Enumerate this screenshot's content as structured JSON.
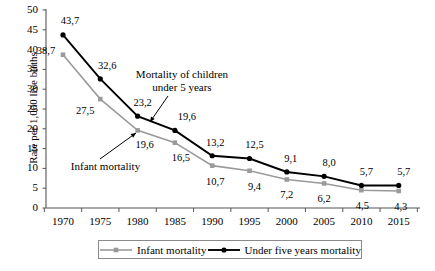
{
  "chart_data": {
    "type": "line",
    "title": "",
    "xlabel": "",
    "ylabel": "Rate per 1,000 live births",
    "categories": [
      "1970",
      "1975",
      "1980",
      "1985",
      "1990",
      "1995",
      "2000",
      "2005",
      "2010",
      "2015"
    ],
    "x": [
      1970,
      1975,
      1980,
      1985,
      1990,
      1995,
      2000,
      2005,
      2010,
      2015
    ],
    "ylim": [
      0,
      50
    ],
    "ytick_step": 5,
    "yticks": [
      "0",
      "5",
      "10",
      "15",
      "20",
      "25",
      "30",
      "35",
      "40",
      "45",
      "50"
    ],
    "grid": false,
    "legend_position": "bottom",
    "series": [
      {
        "name": "Infant mortality",
        "color": "#9a9a9a",
        "marker": "square",
        "values": [
          38.7,
          27.5,
          19.6,
          16.5,
          10.7,
          9.4,
          7.2,
          6.2,
          4.5,
          4.3
        ],
        "labels": [
          "38,7",
          "27,5",
          "19,6",
          "16,5",
          "10,7",
          "9,4",
          "7,2",
          "6,2",
          "4,5",
          "4,3"
        ]
      },
      {
        "name": "Under five years mortality",
        "color": "#000000",
        "marker": "circle",
        "values": [
          43.7,
          32.6,
          23.2,
          19.6,
          13.2,
          12.5,
          9.1,
          8.0,
          5.7,
          5.7
        ],
        "labels": [
          "43,7",
          "32,6",
          "23,2",
          "19,6",
          "13,2",
          "12,5",
          "9,1",
          "8,0",
          "5,7",
          "5,7"
        ]
      }
    ],
    "annotations": [
      {
        "text_line1": "Mortality of children",
        "text_line2": "under 5 years",
        "points_to": "under-five-1985"
      },
      {
        "text_line1": "Infant mortality",
        "text_line2": "",
        "points_to": "infant-1980"
      }
    ]
  },
  "legend": {
    "entries": [
      {
        "label": "Infant mortality",
        "color": "#9a9a9a"
      },
      {
        "label": "Under five years mortality",
        "color": "#000000"
      }
    ]
  },
  "axis": {
    "y_title": "Rate per 1,000 live births"
  }
}
